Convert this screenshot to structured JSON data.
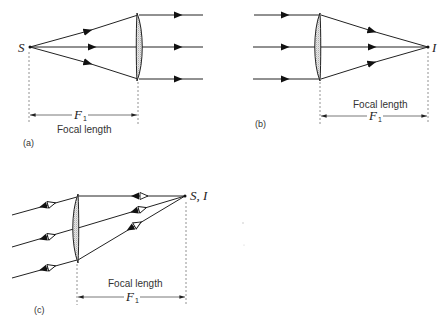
{
  "panels": {
    "a": {
      "label": "(a)",
      "point_label": "S",
      "dimension_symbol": "F",
      "dimension_subscript": "1",
      "dimension_caption": "Focal length"
    },
    "b": {
      "label": "(b)",
      "point_label": "I",
      "dimension_symbol": "F",
      "dimension_subscript": "1",
      "dimension_caption": "Focal length"
    },
    "c": {
      "label": "(c)",
      "point_label": "S, I",
      "dimension_symbol": "F",
      "dimension_subscript": "1",
      "dimension_caption": "Focal length"
    }
  },
  "colors": {
    "line": "#222222",
    "text": "#333333",
    "background": "#ffffff"
  }
}
